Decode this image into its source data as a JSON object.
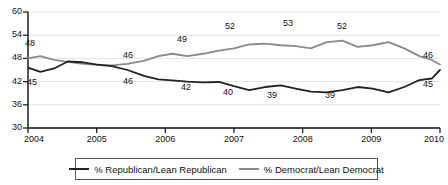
{
  "chart_data": {
    "type": "line",
    "title": "",
    "subtitle": "",
    "xlabel": "",
    "ylabel": "",
    "xlim": [
      2004,
      2010
    ],
    "ylim": [
      30,
      60
    ],
    "yticks": [
      30,
      36,
      42,
      48,
      54,
      60
    ],
    "xticks": [
      2004,
      2005,
      2006,
      2007,
      2008,
      2009,
      2010
    ],
    "grid": true,
    "legend_position": "bottom",
    "series": [
      {
        "name": "% Republican/Lean Republican",
        "color": "#222222",
        "x": [
          2004.0,
          2004.18,
          2004.38,
          2004.58,
          2004.8,
          2005.0,
          2005.22,
          2005.45,
          2005.7,
          2005.9,
          2006.1,
          2006.32,
          2006.55,
          2006.78,
          2007.0,
          2007.22,
          2007.45,
          2007.68,
          2007.9,
          2008.12,
          2008.35,
          2008.58,
          2008.8,
          2009.02,
          2009.25,
          2009.48,
          2009.7,
          2009.88,
          2010.0
        ],
        "values": [
          45.6,
          44.5,
          45.4,
          47.2,
          47.0,
          46.4,
          46.0,
          45.0,
          43.4,
          42.6,
          42.3,
          42.0,
          41.8,
          41.9,
          40.8,
          39.8,
          40.6,
          41.0,
          40.2,
          39.4,
          39.2,
          39.8,
          40.6,
          40.2,
          39.2,
          40.6,
          42.4,
          42.8,
          45.0
        ],
        "labeled_points": [
          {
            "x": 2004.18,
            "value": 45,
            "label": "45"
          },
          {
            "x": 2005.7,
            "value": 43.4,
            "label": "46"
          },
          {
            "x": 2006.55,
            "value": 41.8,
            "label": "42"
          },
          {
            "x": 2007.22,
            "value": 39.8,
            "label": "40"
          },
          {
            "x": 2008.12,
            "value": 39.4,
            "label": "39"
          },
          {
            "x": 2009.25,
            "value": 39.2,
            "label": "39"
          },
          {
            "x": 2010.0,
            "value": 45.0,
            "label": "45"
          }
        ]
      },
      {
        "name": "% Democrat/Lean Democrat",
        "color": "#8a8a8a",
        "x": [
          2004.0,
          2004.18,
          2004.38,
          2004.58,
          2004.8,
          2005.0,
          2005.22,
          2005.45,
          2005.7,
          2005.9,
          2006.1,
          2006.32,
          2006.55,
          2006.78,
          2007.0,
          2007.22,
          2007.45,
          2007.68,
          2007.9,
          2008.12,
          2008.35,
          2008.58,
          2008.8,
          2009.02,
          2009.25,
          2009.48,
          2009.7,
          2009.88,
          2010.0
        ],
        "values": [
          48.0,
          48.6,
          47.6,
          47.1,
          46.6,
          46.4,
          46.2,
          46.6,
          47.4,
          48.6,
          49.2,
          48.6,
          49.2,
          50.0,
          50.6,
          51.6,
          51.8,
          51.4,
          51.2,
          50.6,
          52.2,
          52.6,
          51.0,
          51.4,
          52.2,
          50.6,
          48.6,
          47.6,
          46.4
        ],
        "labeled_points": [
          {
            "x": 2004.0,
            "value": 48.0,
            "label": "48"
          },
          {
            "x": 2005.22,
            "value": 46.2,
            "label": "46"
          },
          {
            "x": 2006.1,
            "value": 49.2,
            "label": "49"
          },
          {
            "x": 2007.22,
            "value": 51.6,
            "label": "52"
          },
          {
            "x": 2008.35,
            "value": 52.2,
            "label": "53"
          },
          {
            "x": 2009.25,
            "value": 52.2,
            "label": "52"
          },
          {
            "x": 2010.0,
            "value": 46.4,
            "label": "46"
          }
        ]
      }
    ]
  },
  "axis": {
    "y_labels": [
      "60",
      "54",
      "48",
      "42",
      "36",
      "30"
    ],
    "x_labels": [
      "2004",
      "2005",
      "2006",
      "2007",
      "2008",
      "2009",
      "2010"
    ]
  },
  "legend": {
    "entries": [
      {
        "label": "% Republican/Lean Republican",
        "color": "#222222"
      },
      {
        "label": "% Democrat/Lean Democrat",
        "color": "#8a8a8a"
      }
    ]
  },
  "data_labels": {
    "republican": [
      {
        "text": "45",
        "x": 32,
        "y": 83
      },
      {
        "text": "46",
        "x": 128,
        "y": 82
      },
      {
        "text": "42",
        "x": 186,
        "y": 88
      },
      {
        "text": "40",
        "x": 228,
        "y": 93
      },
      {
        "text": "39",
        "x": 272,
        "y": 96
      },
      {
        "text": "39",
        "x": 330,
        "y": 96
      },
      {
        "text": "45",
        "x": 428,
        "y": 85
      }
    ],
    "democrat": [
      {
        "text": "48",
        "x": 30,
        "y": 44
      },
      {
        "text": "46",
        "x": 128,
        "y": 56
      },
      {
        "text": "49",
        "x": 182,
        "y": 40
      },
      {
        "text": "52",
        "x": 230,
        "y": 27
      },
      {
        "text": "53",
        "x": 288,
        "y": 24
      },
      {
        "text": "52",
        "x": 342,
        "y": 27
      },
      {
        "text": "46",
        "x": 428,
        "y": 56
      }
    ]
  }
}
